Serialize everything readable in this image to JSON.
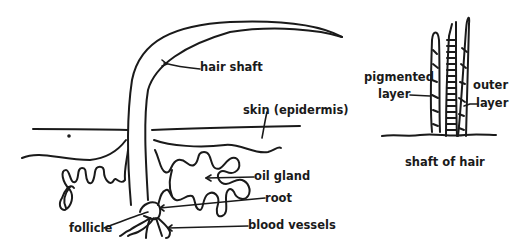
{
  "diagram": {
    "main": {
      "labels": {
        "hair_shaft": "hair shaft",
        "skin": "skin (epidermis)",
        "oil_gland": "oil gland",
        "root": "root",
        "blood_vessels": "blood vessels",
        "follicle": "follicle"
      }
    },
    "inset": {
      "caption": "shaft of hair",
      "labels": {
        "pigmented_line1": "pigmented",
        "pigmented_line2": "layer",
        "outer_line1": "outer",
        "outer_line2": "layer"
      }
    },
    "colors": {
      "ink": "#1a1a1a",
      "background": "#ffffff"
    }
  }
}
